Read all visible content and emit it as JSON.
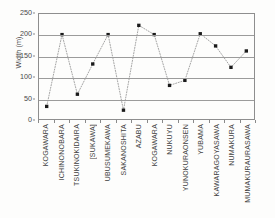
{
  "chart_data": {
    "type": "scatter",
    "title": "",
    "subtitle": "",
    "xlabel": "",
    "ylabel": "Width (m)",
    "ylim": [
      0,
      250
    ],
    "ytick_values": [
      0,
      50,
      100,
      150,
      200,
      250
    ],
    "ytick_labels": [
      "0",
      "50",
      "100",
      "150",
      "200",
      "250"
    ],
    "grid": "horizontal",
    "legend": "none",
    "marker": "filled-square",
    "marker_color": "#1a1a1a",
    "line_style": "dotted",
    "line_color": "#9a9a9a",
    "categories": [
      "KOGAWARA",
      "ICHINONOBARA",
      "TSUKINOKIDAIRA",
      "[SUKAWA]",
      "UBUSUMEKAWA",
      "SAKANOSHITA",
      "AZABU",
      "KOGAWARA",
      "NUKUYU",
      "YUNOKURAONSEN",
      "YUBAMA",
      "KAWARAGOYASAWA",
      "NUMAKURA",
      "MUMAKURAURASAWA"
    ],
    "values": [
      30,
      201,
      59,
      131,
      201,
      21,
      223,
      201,
      80,
      92,
      203,
      174,
      123,
      162
    ]
  }
}
